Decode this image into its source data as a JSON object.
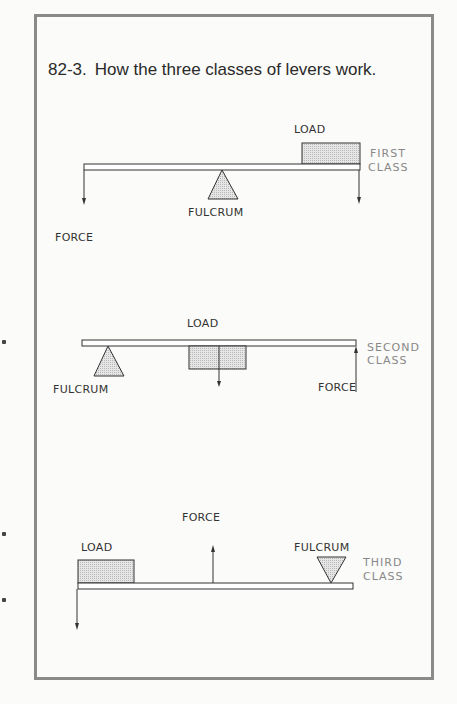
{
  "figure": {
    "number": "82-3.",
    "caption": "How the three classes of levers work."
  },
  "diagrams": [
    {
      "class_label_line1": "FIRST",
      "class_label_line2": "CLASS",
      "load_label": "LOAD",
      "fulcrum_label": "FULCRUM",
      "force_label": "FORCE"
    },
    {
      "class_label_line1": "SECOND",
      "class_label_line2": "CLASS",
      "load_label": "LOAD",
      "fulcrum_label": "FULCRUM",
      "force_label": "FORCE"
    },
    {
      "class_label_line1": "THIRD",
      "class_label_line2": "CLASS",
      "load_label": "LOAD",
      "fulcrum_label": "FULCRUM",
      "force_label": "FORCE"
    }
  ],
  "colors": {
    "border": "#8a8a8a",
    "ink": "#333333",
    "class_label": "#888888",
    "fill_pattern": "#d8d8d8"
  }
}
